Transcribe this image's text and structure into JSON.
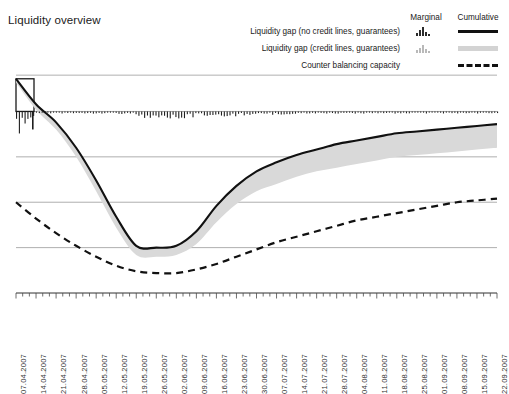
{
  "chart_title": "Liquidity overview",
  "legend": {
    "col_marginal": "Marginal",
    "col_cumulative": "Cumulative",
    "rows": [
      {
        "label": "Liquidity gap (no credit lines, guarantees)",
        "marginal_icon": "bar-glyph-dark",
        "cumulative_icon": "solid-line-black"
      },
      {
        "label": "Liquidity gap (credit lines, guarantees)",
        "marginal_icon": "bar-glyph-gray",
        "cumulative_icon": "gray-band"
      },
      {
        "label": "Counter balancing capacity",
        "marginal_icon": "none",
        "cumulative_icon": "dashed-line-black"
      }
    ]
  },
  "chart_data": {
    "type": "line",
    "title": "Liquidity overview",
    "xlabel": "",
    "ylabel": "",
    "grid": true,
    "legend_position": "top-right",
    "xtick_rotation": -90,
    "categories": [
      "07.04.2007",
      "14.04.2007",
      "21.04.2007",
      "28.04.2007",
      "05.05.2007",
      "12.05.2007",
      "19.05.2007",
      "26.05.2007",
      "02.06.2007",
      "09.06.2007",
      "16.06.2007",
      "23.06.2007",
      "30.06.2007",
      "07.07.2007",
      "14.07.2007",
      "21.07.2007",
      "28.07.2007",
      "04.08.2007",
      "11.08.2007",
      "18.08.2007",
      "25.08.2007",
      "01.09.2007",
      "08.09.2007",
      "15.09.2007",
      "22.09.2007"
    ],
    "ylim": [
      -100,
      30
    ],
    "gridline_values": [
      20,
      0,
      -25,
      -50,
      -75,
      -100
    ],
    "series": [
      {
        "name": "Liquidity gap (no credit lines, guarantees)",
        "kind": "cumulative-line",
        "style": "solid-black",
        "values": [
          18,
          4,
          -6,
          -20,
          -38,
          -58,
          -74,
          -75,
          -74,
          -66,
          -52,
          -41,
          -33,
          -28,
          -24,
          -21,
          -18,
          -16,
          -14,
          -12,
          -11,
          -10,
          -9,
          -8,
          -7
        ]
      },
      {
        "name": "Liquidity gap (credit lines, guarantees)",
        "kind": "cumulative-band",
        "style": "gray-band",
        "values": [
          16,
          1,
          -10,
          -25,
          -44,
          -64,
          -79,
          -80,
          -79,
          -73,
          -61,
          -51,
          -44,
          -40,
          -36,
          -33,
          -31,
          -29,
          -27,
          -25,
          -24,
          -23,
          -22,
          -21,
          -20
        ]
      },
      {
        "name": "Counter balancing capacity",
        "kind": "cumulative-line",
        "style": "dashed-black",
        "values": [
          -50,
          -59,
          -67,
          -74,
          -80,
          -85,
          -88,
          -89,
          -89,
          -87,
          -84,
          -80,
          -76,
          -72,
          -69,
          -66,
          -63,
          -60,
          -58,
          -56,
          -54,
          -52,
          -50,
          -49,
          -48
        ]
      }
    ],
    "marginal_bars": {
      "name": "Marginal liquidity gap",
      "baseline_value": 0,
      "note": "small bars drawn along the zero line",
      "values": [
        -14,
        -1,
        -1,
        -1,
        -1,
        -1,
        -2,
        -6,
        -4,
        -3,
        -2,
        -3,
        -1,
        -2,
        -1,
        -1,
        -1,
        -1,
        -1,
        -1,
        -1,
        -1,
        -1,
        -1,
        -1
      ]
    }
  }
}
